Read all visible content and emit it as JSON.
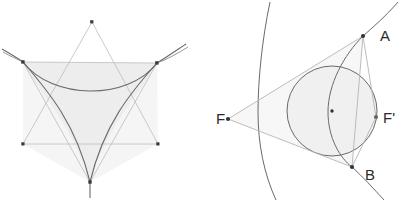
{
  "figure": {
    "background_color": "#ffffff",
    "panels": [
      {
        "id": "left",
        "name": "deltoid-hexagram-panel",
        "description": "Steiner deltoid inscribed in a hexagram of two overlapping triangles with shaded interior region",
        "shaded_fill": "#ededed",
        "thin_line_color": "#b9b9b9",
        "curve_color": "#5e5e5e",
        "point_color": "#3a3a3a",
        "points": [
          {
            "name": "top-apex",
            "label": "",
            "x": 92,
            "y": 22
          },
          {
            "name": "upper-left-vertex",
            "label": "",
            "x": 23,
            "y": 62
          },
          {
            "name": "upper-right-vertex",
            "label": "",
            "x": 157,
            "y": 63
          },
          {
            "name": "lower-left-vertex",
            "label": "",
            "x": 23,
            "y": 144
          },
          {
            "name": "lower-right-vertex",
            "label": "",
            "x": 158,
            "y": 144
          },
          {
            "name": "bottom-apex",
            "label": "",
            "x": 90,
            "y": 182
          }
        ],
        "curves": [
          {
            "name": "deltoid-upper-arc",
            "type": "hypocycloid-arc"
          },
          {
            "name": "deltoid-left-arc",
            "type": "hypocycloid-arc"
          },
          {
            "name": "deltoid-right-arc",
            "type": "hypocycloid-arc"
          },
          {
            "name": "tangent-extension-left",
            "type": "line-extension"
          },
          {
            "name": "tangent-extension-right",
            "type": "line-extension"
          },
          {
            "name": "tangent-extension-bottom",
            "type": "line-extension"
          }
        ]
      },
      {
        "id": "right",
        "name": "hyperbola-incircle-panel",
        "description": "Hyperbola with two branches, foci F and F', an inscribed circle tangent to triangle FAB",
        "shaded_fill": "#f1f1f1",
        "thin_line_color": "#b9b9b9",
        "curve_color": "#5e5e5e",
        "point_color": "#3a3a3a",
        "labels": [
          {
            "name": "label-A",
            "text": "A",
            "x": 178,
            "y": 41,
            "anchor": "start"
          },
          {
            "name": "label-F",
            "text": "F",
            "x": 18,
            "y": 124,
            "anchor": "start"
          },
          {
            "name": "label-F-prime",
            "text": "F'",
            "x": 181,
            "y": 123,
            "anchor": "start"
          },
          {
            "name": "label-B",
            "text": "B",
            "x": 163,
            "y": 180,
            "anchor": "start"
          }
        ],
        "points": [
          {
            "name": "point-A",
            "label": "A",
            "x": 161,
            "y": 36
          },
          {
            "name": "point-F",
            "label": "F",
            "x": 26,
            "y": 119
          },
          {
            "name": "point-F-prime",
            "label": "F'",
            "x": 174,
            "y": 117
          },
          {
            "name": "point-B",
            "label": "B",
            "x": 150,
            "y": 167
          },
          {
            "name": "circle-center",
            "label": "",
            "x": 130,
            "y": 111
          }
        ],
        "circle": {
          "name": "inscribed-circle",
          "cx": 130,
          "cy": 111,
          "r": 45
        },
        "curves": [
          {
            "name": "hyperbola-left-branch",
            "type": "conic-branch"
          },
          {
            "name": "hyperbola-right-branch",
            "type": "conic-branch"
          }
        ],
        "lines": [
          {
            "name": "tangent-F-to-A",
            "from": "F",
            "to": "A"
          },
          {
            "name": "tangent-F-to-B",
            "from": "F",
            "to": "B"
          },
          {
            "name": "chord-A-to-B",
            "from": "A",
            "to": "B"
          },
          {
            "name": "segment-A-to-F-prime",
            "from": "A",
            "to": "F'"
          },
          {
            "name": "segment-F-prime-to-B",
            "from": "F'",
            "to": "B"
          }
        ]
      }
    ]
  }
}
